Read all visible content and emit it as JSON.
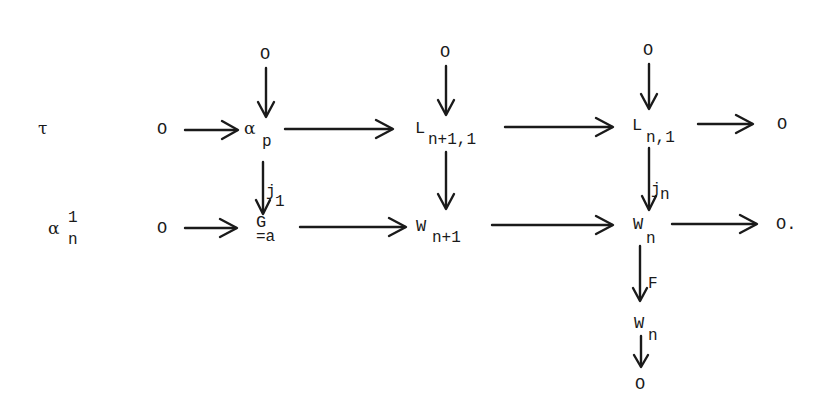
{
  "diagram": {
    "row_labels": {
      "top": "τ",
      "bottom_main": "α",
      "bottom_sup": "1",
      "bottom_sub": "n"
    },
    "nodes": {
      "top_zero_left": "O",
      "alpha_p_main": "α",
      "alpha_p_sub": "p",
      "L_n1_1_main": "L",
      "L_n1_1_sub": "n+1,1",
      "L_n_1_main": "L",
      "L_n_1_sub": "n,1",
      "top_zero_right": "O",
      "zero_above_alpha": "O",
      "zero_above_L_n1": "O",
      "zero_above_L_n": "O",
      "bottom_zero_left": "O",
      "G_main": "G",
      "G_sub": "=a",
      "W_n1_main": "W",
      "W_n1_sub": "n+1",
      "W_n_main": "W",
      "W_n_sub": "n",
      "bottom_zero_right": "O.",
      "W_n_lower_main": "W",
      "W_n_lower_sub": "n",
      "zero_bottom": "O"
    },
    "arrow_labels": {
      "j1": "j",
      "j1_sub": "1",
      "jn": "j",
      "jn_sub": "n",
      "F": "F"
    }
  }
}
